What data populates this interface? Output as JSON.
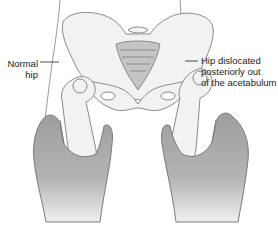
{
  "figure": {
    "colors": {
      "bone_fill": "#f2f2f2",
      "bone_stroke": "#8a8a8a",
      "skin_outline": "#9a9a9a",
      "hand_fill": "#a8a8a8",
      "hand_fill_light": "#e6e6e6",
      "background": "#ffffff",
      "text": "#222222"
    }
  },
  "labels": {
    "left": {
      "lines": [
        "Normal",
        "hip"
      ]
    },
    "right": {
      "lines": [
        "Hip dislocated",
        "posteriorly out",
        "of the acetabulum"
      ]
    }
  }
}
